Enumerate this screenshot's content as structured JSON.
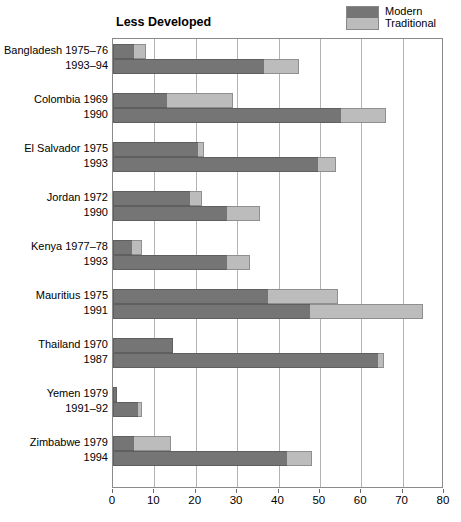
{
  "plot_title": "Less Developed",
  "legend": {
    "position": "top-right",
    "entries": [
      {
        "label": "Modern",
        "color": "#757575",
        "key": "modern"
      },
      {
        "label": "Traditional",
        "color": "#bcbcbc",
        "key": "traditional"
      }
    ]
  },
  "axis": {
    "x_ticks": [
      "0",
      "10",
      "20",
      "30",
      "40",
      "50",
      "60",
      "70",
      "80"
    ],
    "x_min": 0,
    "x_max": 80,
    "x_step": 10
  },
  "chart_data": {
    "type": "bar",
    "orientation": "horizontal",
    "stacked": true,
    "title": "Less Developed",
    "xlabel": "",
    "ylabel": "",
    "xlim": [
      0,
      80
    ],
    "grid": true,
    "legend_position": "top-right",
    "series": [
      {
        "name": "Modern",
        "color": "#757575",
        "values": [
          5.0,
          36.5,
          13.0,
          55.0,
          20.5,
          49.5,
          18.5,
          27.5,
          4.5,
          27.5,
          37.5,
          47.5,
          14.5,
          64.0,
          1.0,
          6.0,
          5.0,
          42.0
        ]
      },
      {
        "name": "Traditional",
        "color": "#bcbcbc",
        "values": [
          3.0,
          8.5,
          16.0,
          11.0,
          1.5,
          4.5,
          3.0,
          8.0,
          2.5,
          5.5,
          17.0,
          27.5,
          0.0,
          1.5,
          0.0,
          1.0,
          9.0,
          6.0
        ]
      }
    ],
    "categories": [
      "Bangladesh 1975–76",
      "1993–94",
      "Colombia 1969",
      "1990",
      "El Salvador 1975",
      "1993",
      "Jordan 1972",
      "1990",
      "Kenya 1977–78",
      "1993",
      "Mauritius 1975",
      "1991",
      "Thailand 1970",
      "1987",
      "Yemen 1979",
      "1991–92",
      "Zimbabwe 1979",
      "1994"
    ],
    "totals": [
      8.0,
      45.0,
      29.0,
      66.0,
      22.0,
      54.0,
      21.5,
      35.5,
      7.0,
      33.0,
      54.5,
      75.0,
      14.5,
      65.5,
      1.0,
      7.0,
      14.0,
      48.0
    ],
    "groups": [
      {
        "country": "Bangladesh",
        "rows": [
          0,
          1
        ]
      },
      {
        "country": "Colombia",
        "rows": [
          2,
          3
        ]
      },
      {
        "country": "El Salvador",
        "rows": [
          4,
          5
        ]
      },
      {
        "country": "Jordan",
        "rows": [
          6,
          7
        ]
      },
      {
        "country": "Kenya",
        "rows": [
          8,
          9
        ]
      },
      {
        "country": "Mauritius",
        "rows": [
          10,
          11
        ]
      },
      {
        "country": "Thailand",
        "rows": [
          12,
          13
        ]
      },
      {
        "country": "Yemen",
        "rows": [
          14,
          15
        ]
      },
      {
        "country": "Zimbabwe",
        "rows": [
          16,
          17
        ]
      }
    ]
  }
}
